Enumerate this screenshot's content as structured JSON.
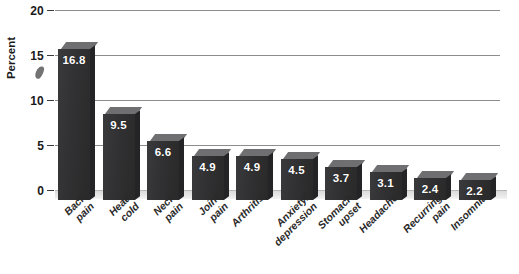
{
  "chart_data": {
    "type": "bar",
    "title": "",
    "xlabel": "",
    "ylabel": "Percent",
    "ylim": [
      0,
      20
    ],
    "yticks": [
      0,
      5,
      10,
      15,
      20
    ],
    "grid": true,
    "legend": "none",
    "style": "3d-bar",
    "categories": [
      "Back pain",
      "Head cold",
      "Neck pain",
      "Joint pain",
      "Arthritis",
      "Anxiety/depression",
      "Stomach upset",
      "Headache",
      "Recurring pain",
      "Insomnia"
    ],
    "values": [
      16.8,
      9.5,
      6.6,
      4.9,
      4.9,
      4.5,
      3.7,
      3.1,
      2.4,
      2.2
    ],
    "value_labels": [
      "16.8",
      "9.5",
      "6.6",
      "4.9",
      "4.9",
      "4.5",
      "3.7",
      "3.1",
      "2.4",
      "2.2"
    ],
    "category_label_lines": [
      [
        "Back",
        "pain"
      ],
      [
        "Head",
        "cold"
      ],
      [
        "Neck",
        "pain"
      ],
      [
        "Joint",
        "pain"
      ],
      [
        "Arthritis"
      ],
      [
        "Anxiety/",
        "depression"
      ],
      [
        "Stomach",
        "upset"
      ],
      [
        "Headache"
      ],
      [
        "Recurring",
        "pain"
      ],
      [
        "Insomnia"
      ]
    ],
    "colors": {
      "bar_front": "#313133",
      "bar_top": "#6f6f71",
      "bar_side": "#242426",
      "gridline": "#8d8d8d",
      "value_text": "#ffffff",
      "axis_text": "#1a1a1a",
      "background": "#ffffff",
      "floor": "#e2e2e2"
    }
  },
  "axis": {
    "y_tick_labels": [
      "20",
      "15",
      "10",
      "5",
      "0"
    ],
    "y_title": "Percent"
  }
}
